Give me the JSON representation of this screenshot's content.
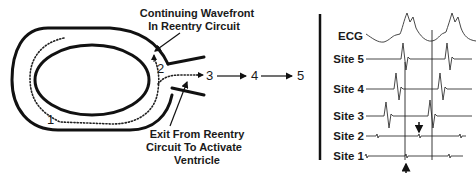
{
  "left_panel": {
    "annotations": {
      "continuing_line1": "Continuing Wavefront",
      "continuing_line2": "In Reentry Circuit",
      "exit_line1": "Exit From Reentry",
      "exit_line2": "Circuit To Activate",
      "exit_line3": "Ventricle"
    },
    "points": {
      "p1": "1",
      "p2": "2",
      "p3": "3",
      "p4": "4",
      "p5": "5"
    }
  },
  "right_panel": {
    "traces": [
      {
        "label": "ECG"
      },
      {
        "label": "Site 5"
      },
      {
        "label": "Site 4"
      },
      {
        "label": "Site 3"
      },
      {
        "label": "Site 2"
      },
      {
        "label": "Site 1"
      }
    ]
  },
  "colors": {
    "ink": "#111111",
    "background": "#ffffff"
  }
}
